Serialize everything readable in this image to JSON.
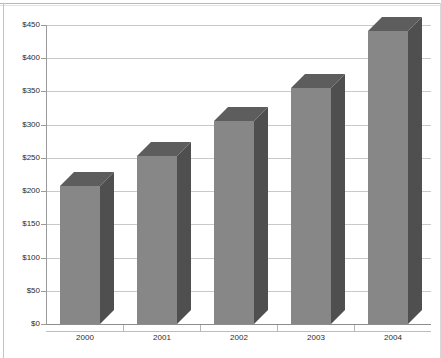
{
  "chart_data": {
    "type": "bar",
    "title": "",
    "subtitle": "",
    "xlabel": "",
    "ylabel": "",
    "categories": [
      "2000",
      "2001",
      "2002",
      "2003",
      "2004"
    ],
    "values": [
      208,
      253,
      306,
      355,
      441
    ],
    "ylim": [
      0,
      450
    ],
    "ytick_values": [
      0,
      50,
      100,
      150,
      200,
      250,
      300,
      350,
      400,
      450
    ],
    "ytick_labels": [
      "$0",
      "$50",
      "$100",
      "$150",
      "$200",
      "$250",
      "$300",
      "$350",
      "$400",
      "$450"
    ],
    "grid": true,
    "legend": "none",
    "style": "3d-column",
    "colors": {
      "bar_front": "#878787",
      "bar_side": "#4f4f4f",
      "bar_top": "#5d5d5d",
      "gridline": "#c9c9c9",
      "axis": "#9a9a9a",
      "text": "#2b2b2b",
      "background": "#ffffff"
    }
  }
}
